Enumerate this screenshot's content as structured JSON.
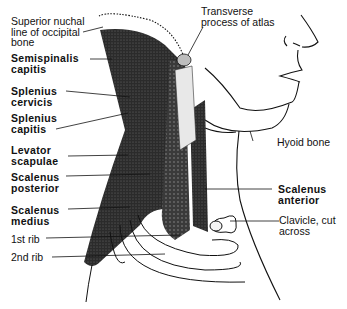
{
  "diagram": {
    "colors": {
      "ink": "#111111",
      "background": "#ffffff",
      "muscle_fill": "#2a2a2a"
    },
    "labels_left": [
      {
        "id": "superior-nuchal-line",
        "text": "Superior nuchal\nline of occipital\nbone",
        "bold": false
      },
      {
        "id": "semispinalis-capitis",
        "text": "Semispinalis\ncapitis",
        "bold": true
      },
      {
        "id": "splenius-cervicis",
        "text": "Splenius\ncervicis",
        "bold": true
      },
      {
        "id": "splenius-capitis",
        "text": "Splenius\ncapitis",
        "bold": true
      },
      {
        "id": "levator-scapulae",
        "text": "Levator\nscapulae",
        "bold": true
      },
      {
        "id": "scalenus-posterior",
        "text": "Scalenus\nposterior",
        "bold": true
      },
      {
        "id": "scalenus-medius",
        "text": "Scalenus\nmedius",
        "bold": true
      },
      {
        "id": "first-rib",
        "text": "1st rib",
        "bold": false
      },
      {
        "id": "second-rib",
        "text": "2nd rib",
        "bold": false
      }
    ],
    "labels_right": [
      {
        "id": "transverse-process-atlas",
        "text": "Transverse\nprocess of atlas",
        "bold": false
      },
      {
        "id": "hyoid-bone",
        "text": "Hyoid bone",
        "bold": false
      },
      {
        "id": "scalenus-anterior",
        "text": "Scalenus\nanterior",
        "bold": true
      },
      {
        "id": "clavicle-cut",
        "text": "Clavicle, cut\nacross",
        "bold": false
      }
    ]
  }
}
